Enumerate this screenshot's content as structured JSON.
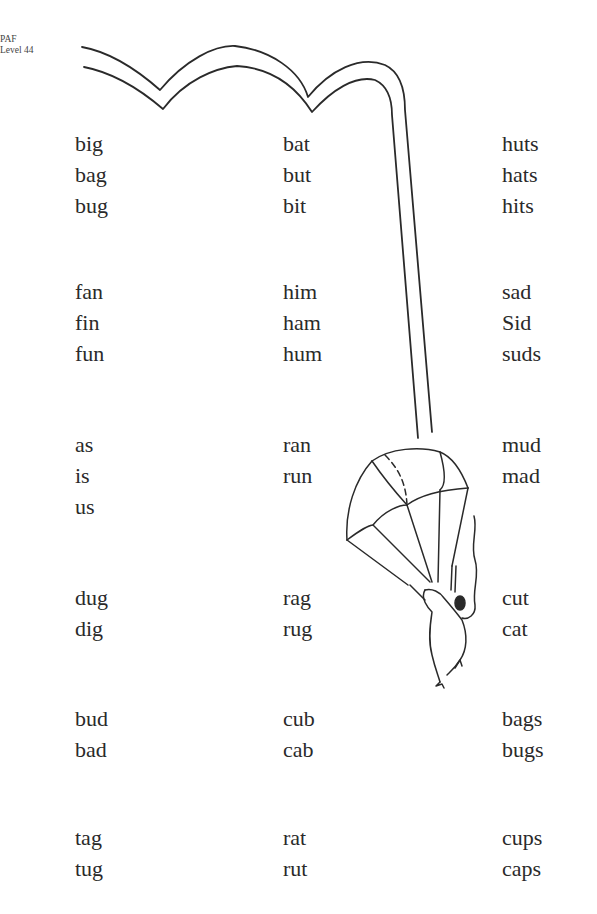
{
  "header": {
    "line1": "PAF",
    "line2": "Level 44"
  },
  "illustration": {
    "description": "mouse hanging from parachute with long double-line string looping across top of page"
  },
  "columns_x": [
    75,
    283,
    502
  ],
  "groups": [
    {
      "top": 128,
      "columns": [
        [
          "big",
          "bag",
          "bug"
        ],
        [
          "bat",
          "but",
          "bit"
        ],
        [
          "huts",
          "hats",
          "hits"
        ]
      ]
    },
    {
      "top": 276,
      "columns": [
        [
          "fan",
          "fin",
          "fun"
        ],
        [
          "him",
          "ham",
          "hum"
        ],
        [
          "sad",
          "Sid",
          "suds"
        ]
      ]
    },
    {
      "top": 429,
      "columns": [
        [
          "as",
          "is",
          "us"
        ],
        [
          "ran",
          "run"
        ],
        [
          "mud",
          "mad"
        ]
      ]
    },
    {
      "top": 582,
      "columns": [
        [
          "dug",
          "dig"
        ],
        [
          "rag",
          "rug"
        ],
        [
          "cut",
          "cat"
        ]
      ]
    },
    {
      "top": 703,
      "columns": [
        [
          "bud",
          "bad"
        ],
        [
          "cub",
          "cab"
        ],
        [
          "bags",
          "bugs"
        ]
      ]
    },
    {
      "top": 822,
      "columns": [
        [
          "tag",
          "tug"
        ],
        [
          "rat",
          "rut"
        ],
        [
          "cups",
          "caps"
        ]
      ]
    }
  ]
}
